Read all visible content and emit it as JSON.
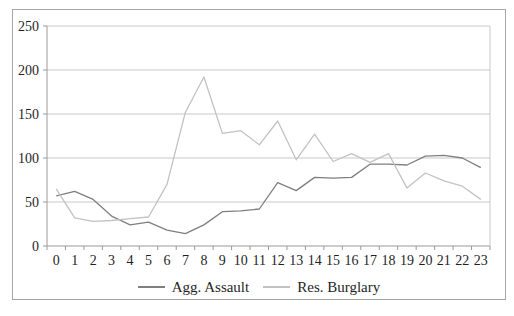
{
  "chart_data": {
    "type": "line",
    "title": "",
    "xlabel": "",
    "ylabel": "",
    "categories": [
      "0",
      "1",
      "2",
      "3",
      "4",
      "5",
      "6",
      "7",
      "8",
      "9",
      "10",
      "11",
      "12",
      "13",
      "14",
      "15",
      "16",
      "17",
      "18",
      "19",
      "20",
      "21",
      "22",
      "23"
    ],
    "series": [
      {
        "name": "Agg. Assault",
        "color": "#7f7f7f",
        "values": [
          57,
          62,
          53,
          34,
          24,
          27,
          18,
          14,
          24,
          39,
          40,
          42,
          72,
          63,
          78,
          77,
          78,
          93,
          93,
          92,
          102,
          103,
          100,
          89
        ]
      },
      {
        "name": "Res. Burglary",
        "color": "#c2c2c2",
        "values": [
          65,
          32,
          28,
          29,
          31,
          33,
          70,
          152,
          192,
          128,
          131,
          115,
          142,
          98,
          127,
          96,
          105,
          95,
          105,
          66,
          83,
          74,
          68,
          53
        ]
      }
    ],
    "ylim": [
      0,
      250
    ],
    "yticks": [
      0,
      50,
      100,
      150,
      200,
      250
    ],
    "grid": true,
    "legend_position": "bottom",
    "colors": {
      "gridline": "#c9c9c9",
      "axis": "#9a9a9a",
      "tick_text": "#1f1f1f",
      "frame_border": "#a6a6a6",
      "background": "#ffffff"
    }
  }
}
